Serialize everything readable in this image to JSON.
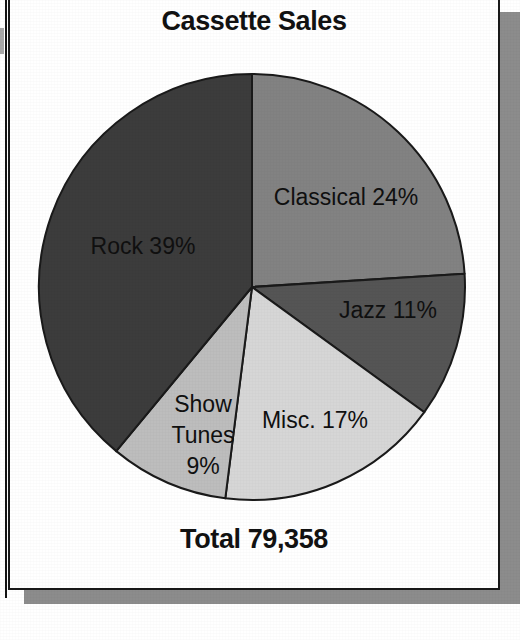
{
  "chart_data": {
    "type": "pie",
    "title": "Cassette Sales",
    "total_label": "Total 79,358",
    "total_value": 79358,
    "categories": [
      "Classical",
      "Jazz",
      "Misc.",
      "Show Tunes",
      "Rock"
    ],
    "values": [
      24,
      11,
      17,
      9,
      39
    ],
    "value_unit": "%",
    "start_angle_deg": 0,
    "direction": "clockwise",
    "legend": "none",
    "grid": false,
    "slices": [
      {
        "name": "Classical",
        "percent": 24,
        "label": "Classical 24%",
        "color": "#828282",
        "start_deg": 0,
        "end_deg": 86.4,
        "label_x": 346,
        "label_y": 205,
        "label_anchor": "middle"
      },
      {
        "name": "Jazz",
        "percent": 11,
        "label": "Jazz 11%",
        "color": "#555555",
        "start_deg": 86.4,
        "end_deg": 126,
        "label_x": 388,
        "label_y": 318,
        "label_anchor": "middle"
      },
      {
        "name": "Misc.",
        "percent": 17,
        "label": "Misc. 17%",
        "color": "#d6d6d6",
        "start_deg": 126,
        "end_deg": 187.2,
        "label_x": 315,
        "label_y": 428,
        "label_anchor": "middle"
      },
      {
        "name": "Show Tunes",
        "percent": 9,
        "label": "Show Tunes 9%",
        "color": "#bdbdbd",
        "label_lines": [
          "Show",
          "Tunes",
          "9%"
        ],
        "start_deg": 187.2,
        "end_deg": 219.6,
        "label_x": 203,
        "label_y": 412,
        "label_anchor": "middle"
      },
      {
        "name": "Rock",
        "percent": 39,
        "label": "Rock 39%",
        "color": "#3c3c3c",
        "start_deg": 219.6,
        "end_deg": 360,
        "label_x": 143,
        "label_y": 254,
        "label_anchor": "middle"
      }
    ],
    "geometry": {
      "center_x": 252,
      "center_y": 287,
      "radius": 213
    },
    "colors": {
      "outline": "#1a1a1a",
      "text": "#101010",
      "background": "#ffffff",
      "shadow": "#8c8c8c"
    }
  },
  "labels": {
    "show_tunes_line1": "Show",
    "show_tunes_line2": "Tunes",
    "show_tunes_line3": "9%"
  }
}
